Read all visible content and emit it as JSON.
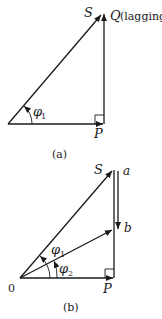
{
  "diagram_a": {
    "caption": "(a)",
    "labels": {
      "S": "S",
      "Q": "Q",
      "Q_note": "(lagging)",
      "P": "P",
      "phi": "φ",
      "phi_sub": "1"
    }
  },
  "diagram_b": {
    "caption": "(b)",
    "labels": {
      "S": "S",
      "a": "a",
      "b": "b",
      "O": "0",
      "P": "P",
      "phi1": "φ",
      "phi1_sub": "1",
      "phi2": "φ",
      "phi2_sub": "2"
    }
  },
  "colors": {
    "stroke": "#1a1a1a",
    "background": "#ffffff"
  }
}
